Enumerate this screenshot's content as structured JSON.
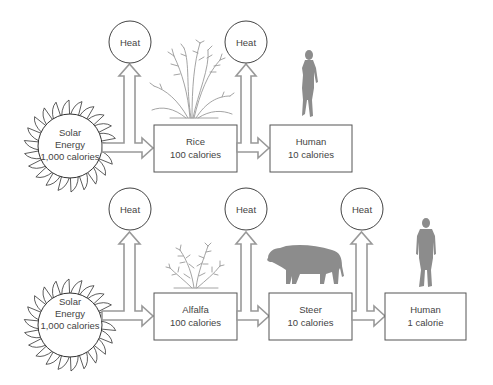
{
  "diagram": {
    "heat_label": "Heat",
    "rows": [
      {
        "name": "rice-chain",
        "source": {
          "line1": "Solar",
          "line2": "Energy",
          "line3": "1,000 calories"
        },
        "nodes": [
          {
            "name": "Rice",
            "value": "100 calories",
            "illustration": "rice-plant-icon"
          },
          {
            "name": "Human",
            "value": "10 calories",
            "illustration": "woman-silhouette-icon"
          }
        ],
        "heat_outputs": [
          "Heat",
          "Heat"
        ]
      },
      {
        "name": "alfalfa-steer-chain",
        "source": {
          "line1": "Solar",
          "line2": "Energy",
          "line3": "1,000 calories"
        },
        "nodes": [
          {
            "name": "Alfalfa",
            "value": "100 calories",
            "illustration": "alfalfa-plant-icon"
          },
          {
            "name": "Steer",
            "value": "10 calories",
            "illustration": "steer-silhouette-icon"
          },
          {
            "name": "Human",
            "value": "1 calorie",
            "illustration": "man-silhouette-icon"
          }
        ],
        "heat_outputs": [
          "Heat",
          "Heat",
          "Heat"
        ]
      }
    ],
    "colors": {
      "box_stroke": "#555555",
      "arrow_stroke": "#999999",
      "silhouette": "#8c8c8c",
      "text": "#444444"
    }
  }
}
